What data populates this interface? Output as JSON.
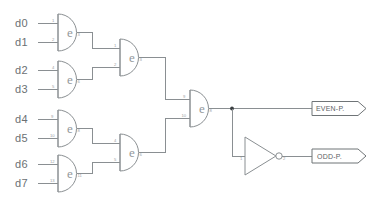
{
  "diagram": {
    "background_color": "#ffffff",
    "wire_color": "#8a8f92",
    "text_color": "#6b7073",
    "junction_color": "#3b3f42"
  },
  "inputs": [
    {
      "label": "d0",
      "pin": "1"
    },
    {
      "label": "d1",
      "pin": "2"
    },
    {
      "label": "d2",
      "pin": "4"
    },
    {
      "label": "d3",
      "pin": "5"
    },
    {
      "label": "d4",
      "pin": "9"
    },
    {
      "label": "d5",
      "pin": "10"
    },
    {
      "label": "d6",
      "pin": "12"
    },
    {
      "label": "d7",
      "pin": "13"
    }
  ],
  "gates": [
    {
      "id": "xor-a",
      "glyph": "e",
      "type": "xor",
      "in_pins": [
        "1",
        "2"
      ],
      "out_pin": "3"
    },
    {
      "id": "xor-b",
      "glyph": "e",
      "type": "xor",
      "in_pins": [
        "4",
        "5"
      ],
      "out_pin": "6"
    },
    {
      "id": "xor-c",
      "glyph": "e",
      "type": "xor",
      "in_pins": [
        "9",
        "10"
      ],
      "out_pin": "8"
    },
    {
      "id": "xor-d",
      "glyph": "e",
      "type": "xor",
      "in_pins": [
        "12",
        "13"
      ],
      "out_pin": "11"
    },
    {
      "id": "xor-e",
      "glyph": "e",
      "type": "xor",
      "in_pins": [
        "1",
        "2"
      ],
      "out_pin": "3"
    },
    {
      "id": "xor-f",
      "glyph": "e",
      "type": "xor",
      "in_pins": [
        "4",
        "5"
      ],
      "out_pin": "6"
    },
    {
      "id": "xor-g",
      "glyph": "e",
      "type": "xor",
      "in_pins": [
        "9",
        "10"
      ],
      "out_pin": "8"
    }
  ],
  "inverter": {
    "id": "not-1",
    "type": "inverter",
    "in_pin": "1",
    "out_pin": "2"
  },
  "outputs": [
    {
      "label": "EVEN-P.",
      "id": "even-parity"
    },
    {
      "label": "ODD-P.",
      "id": "odd-parity"
    }
  ]
}
